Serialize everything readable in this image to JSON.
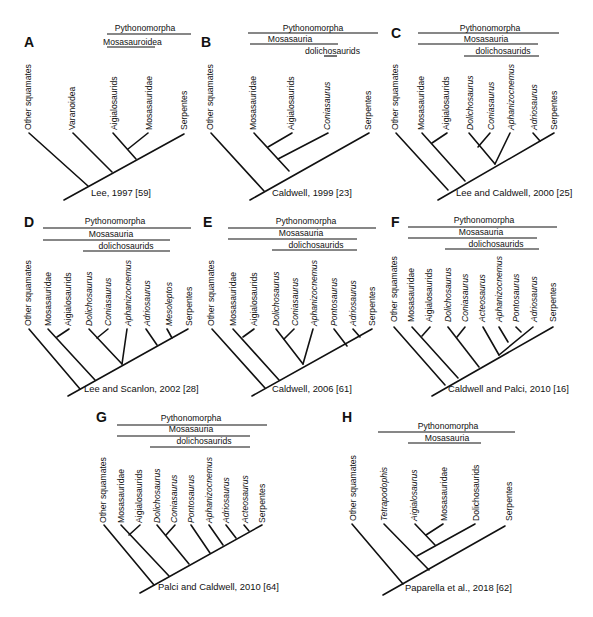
{
  "figure": {
    "panels": [
      {
        "letter": "A",
        "citation": "Lee, 1997 [59]",
        "clades": [
          "Pythonomorpha",
          "Mosasauroidea"
        ],
        "taxa": [
          {
            "name": "Other squamates",
            "italic": false
          },
          {
            "name": "Varanoidea",
            "italic": false
          },
          {
            "name": "Aigialosaurids",
            "italic": false
          },
          {
            "name": "Mosasauridae",
            "italic": false
          },
          {
            "name": "Serpentes",
            "italic": false
          }
        ]
      },
      {
        "letter": "B",
        "citation": "Caldwell, 1999 [23]",
        "clades": [
          "Pythonomorpha",
          "Mosasauria",
          "dolichosaurids"
        ],
        "taxa": [
          {
            "name": "Other squamates",
            "italic": false
          },
          {
            "name": "Mosasauridae",
            "italic": false
          },
          {
            "name": "Aigialosaurids",
            "italic": false
          },
          {
            "name": "Coniasaurus",
            "italic": true
          },
          {
            "name": "Serpentes",
            "italic": false
          }
        ]
      },
      {
        "letter": "C",
        "citation": "Lee and Caldwell, 2000 [25]",
        "clades": [
          "Pythonomorpha",
          "Mosasauria",
          "dolichosaurids"
        ],
        "taxa": [
          {
            "name": "Other squamates",
            "italic": false
          },
          {
            "name": "Mosasauridae",
            "italic": false
          },
          {
            "name": "Aigialosaurids",
            "italic": false
          },
          {
            "name": "Dolichosaurus",
            "italic": true
          },
          {
            "name": "Coniasaurus",
            "italic": true
          },
          {
            "name": "Aphanizocnemus",
            "italic": true
          },
          {
            "name": "Adriosaurus",
            "italic": true
          },
          {
            "name": "Serpentes",
            "italic": false
          }
        ]
      },
      {
        "letter": "D",
        "citation": "Lee and Scanlon, 2002 [28]",
        "clades": [
          "Pythonomorpha",
          "Mosasauria",
          "dolichosaurids"
        ],
        "taxa": [
          {
            "name": "Other squamates",
            "italic": false
          },
          {
            "name": "Mosasauridae",
            "italic": false
          },
          {
            "name": "Aigialosaurids",
            "italic": false
          },
          {
            "name": "Dolichosaurus",
            "italic": true
          },
          {
            "name": "Coniasaurus",
            "italic": true
          },
          {
            "name": "Aphanizocnemus",
            "italic": true
          },
          {
            "name": "Adriosaurus",
            "italic": true
          },
          {
            "name": "Mesoleptos",
            "italic": true
          },
          {
            "name": "Serpentes",
            "italic": false
          }
        ]
      },
      {
        "letter": "E",
        "citation": "Caldwell, 2006 [61]",
        "clades": [
          "Pythonomorpha",
          "Mosasauria",
          "dolichosaurids"
        ],
        "taxa": [
          {
            "name": "Other squamates",
            "italic": false
          },
          {
            "name": "Mosasauridae",
            "italic": false
          },
          {
            "name": "Aigialosaurids",
            "italic": false
          },
          {
            "name": "Dolichosaurus",
            "italic": true
          },
          {
            "name": "Coniasaurus",
            "italic": true
          },
          {
            "name": "Aphanizocnemus",
            "italic": true
          },
          {
            "name": "Pontosaurus",
            "italic": true
          },
          {
            "name": "Adriosaurus",
            "italic": true
          },
          {
            "name": "Serpentes",
            "italic": false
          }
        ]
      },
      {
        "letter": "F",
        "citation": "Caldwell and Palci, 2010 [16]",
        "clades": [
          "Pythonomorpha",
          "Mosasauria",
          "dolichosaurids"
        ],
        "taxa": [
          {
            "name": "Other squamates",
            "italic": false
          },
          {
            "name": "Mosasauridae",
            "italic": false
          },
          {
            "name": "Aigialosaurids",
            "italic": false
          },
          {
            "name": "Dolichosaurus",
            "italic": true
          },
          {
            "name": "Coniasaurus",
            "italic": true
          },
          {
            "name": "Acteosaurus",
            "italic": true
          },
          {
            "name": "Aphanizocnemus",
            "italic": true
          },
          {
            "name": "Pontosaurus",
            "italic": true
          },
          {
            "name": "Adriosaurus",
            "italic": true
          },
          {
            "name": "Serpentes",
            "italic": false
          }
        ]
      },
      {
        "letter": "G",
        "citation": "Palci and Caldwell, 2010 [64]",
        "clades": [
          "Pythonomorpha",
          "Mosasauria",
          "dolichosaurids"
        ],
        "taxa": [
          {
            "name": "Other squamates",
            "italic": false
          },
          {
            "name": "Mosasauridae",
            "italic": false
          },
          {
            "name": "Aigialosaurids",
            "italic": false
          },
          {
            "name": "Dolichosaurus",
            "italic": true
          },
          {
            "name": "Coniasaurus",
            "italic": true
          },
          {
            "name": "Pontosaurus",
            "italic": true
          },
          {
            "name": "Aphanizocnemus",
            "italic": true
          },
          {
            "name": "Adriosaurus",
            "italic": true
          },
          {
            "name": "Acteosaurus",
            "italic": true
          },
          {
            "name": "Serpentes",
            "italic": false
          }
        ]
      },
      {
        "letter": "H",
        "citation": "Paparella et al., 2018 [62]",
        "clades": [
          "Pythonomorpha",
          "Mosasauria"
        ],
        "taxa": [
          {
            "name": "Other squamates",
            "italic": false
          },
          {
            "name": "Tetrapodophis",
            "italic": true
          },
          {
            "name": "Aigialosaurus",
            "italic": true
          },
          {
            "name": "Mosasauridae",
            "italic": false
          },
          {
            "name": "Dolichosaurids",
            "italic": false
          },
          {
            "name": "Serpentes",
            "italic": false
          }
        ]
      }
    ]
  }
}
